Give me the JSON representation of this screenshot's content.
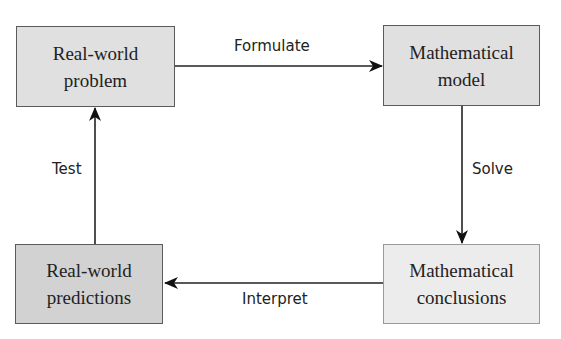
{
  "diagram": {
    "type": "cycle-flowchart",
    "nodes": [
      {
        "id": "real-world-problem",
        "line1": "Real-world",
        "line2": "problem",
        "fill": "#e0e0e0"
      },
      {
        "id": "mathematical-model",
        "line1": "Mathematical",
        "line2": "model",
        "fill": "#e0e0e0"
      },
      {
        "id": "mathematical-conclusions",
        "line1": "Mathematical",
        "line2": "conclusions",
        "fill": "#ececec"
      },
      {
        "id": "real-world-predictions",
        "line1": "Real-world",
        "line2": "predictions",
        "fill": "#d2d2d2"
      }
    ],
    "edges": [
      {
        "from": "real-world-problem",
        "to": "mathematical-model",
        "label": "Formulate"
      },
      {
        "from": "mathematical-model",
        "to": "mathematical-conclusions",
        "label": "Solve"
      },
      {
        "from": "mathematical-conclusions",
        "to": "real-world-predictions",
        "label": "Interpret"
      },
      {
        "from": "real-world-predictions",
        "to": "real-world-problem",
        "label": "Test"
      }
    ]
  }
}
